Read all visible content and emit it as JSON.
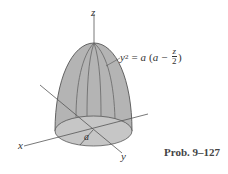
{
  "figure": {
    "axes": {
      "x": "x",
      "y": "y",
      "z": "z"
    },
    "dimension_label": "a",
    "equation": {
      "lhs_var": "y",
      "lhs_exp": "2",
      "equals": "=",
      "coef": "a",
      "open_paren": "(",
      "inner_var": "a",
      "minus": "−",
      "frac_num": "z",
      "frac_den": "2",
      "close_paren": ")"
    },
    "caption": "Prob. 9–127",
    "colors": {
      "surface": "#b4b4b4",
      "base": "#c6c6c6",
      "line": "#555555"
    }
  }
}
